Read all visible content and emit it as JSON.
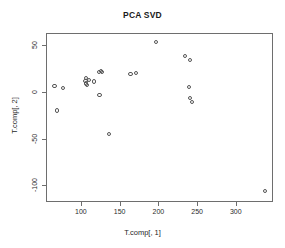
{
  "chart_data": {
    "type": "scatter",
    "title": "PCA SVD",
    "xlabel": "T.comp[, 1]",
    "ylabel": "T.comp[, 2]",
    "xlim": [
      55,
      348
    ],
    "ylim": [
      -118,
      63
    ],
    "xticks": [
      100,
      150,
      200,
      250,
      300
    ],
    "xtick_labels": [
      "100",
      "150",
      "200",
      "250",
      "300"
    ],
    "yticks": [
      50,
      0,
      -50,
      -100
    ],
    "ytick_labels": [
      "50",
      "0",
      "-50",
      "-100"
    ],
    "grid": false,
    "legend": false,
    "marker": "open-circle",
    "marker_color": "#555555",
    "points": [
      {
        "x": 66,
        "y": 6
      },
      {
        "x": 77,
        "y": 4
      },
      {
        "x": 69,
        "y": -20
      },
      {
        "x": 106,
        "y": 12
      },
      {
        "x": 107,
        "y": 15
      },
      {
        "x": 107,
        "y": 9
      },
      {
        "x": 108,
        "y": 7
      },
      {
        "x": 110,
        "y": 13
      },
      {
        "x": 117,
        "y": 11
      },
      {
        "x": 123,
        "y": 21
      },
      {
        "x": 126,
        "y": 22
      },
      {
        "x": 127,
        "y": 21
      },
      {
        "x": 124,
        "y": -3
      },
      {
        "x": 136,
        "y": -45
      },
      {
        "x": 164,
        "y": 19
      },
      {
        "x": 171,
        "y": 20
      },
      {
        "x": 197,
        "y": 53
      },
      {
        "x": 234,
        "y": 38
      },
      {
        "x": 241,
        "y": 34
      },
      {
        "x": 240,
        "y": 5
      },
      {
        "x": 241,
        "y": -7
      },
      {
        "x": 243,
        "y": -11
      },
      {
        "x": 338,
        "y": -106
      }
    ]
  }
}
